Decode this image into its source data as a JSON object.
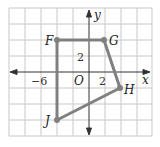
{
  "diagram": {
    "type": "coordinate-plane-polygon",
    "axes": {
      "x_label": "x",
      "y_label": "y",
      "origin_label": "O",
      "tick_labels": [
        {
          "axis": "x",
          "value": -6,
          "text": "−6"
        },
        {
          "axis": "x",
          "value": 2,
          "text": "2"
        },
        {
          "axis": "y",
          "value": 2,
          "text": "2"
        }
      ],
      "grid_step_units": 2
    },
    "vertices": [
      {
        "name": "F",
        "x": -4,
        "y": 4
      },
      {
        "name": "G",
        "x": 2,
        "y": 4
      },
      {
        "name": "H",
        "x": 4,
        "y": -2
      },
      {
        "name": "J",
        "x": -4,
        "y": -6
      }
    ],
    "colors": {
      "polygon": "#808080",
      "grid": "#c8c8c8",
      "axis": "#333333"
    }
  }
}
